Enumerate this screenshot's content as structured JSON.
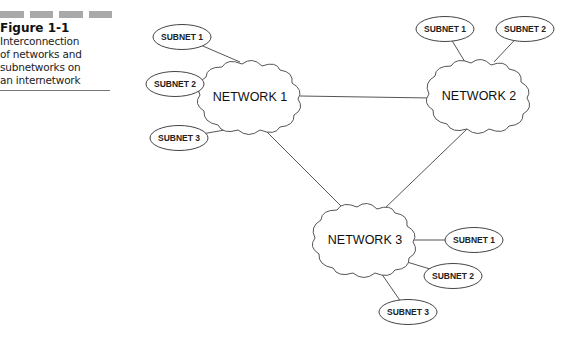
{
  "caption": {
    "figure_label": "Figure 1-1",
    "lines": [
      "Interconnection",
      "of networks and",
      "subnetworks on",
      "an internetwork"
    ],
    "bar_color": "#a9a9a9"
  },
  "networks": [
    {
      "id": "n1",
      "label": "NETWORK 1",
      "cx": 250,
      "cy": 97
    },
    {
      "id": "n2",
      "label": "NETWORK 2",
      "cx": 479,
      "cy": 96
    },
    {
      "id": "n3",
      "label": "NETWORK 3",
      "cx": 365,
      "cy": 240
    }
  ],
  "subnets": [
    {
      "network": "n1",
      "label": "SUBNET 1",
      "cx": 182,
      "cy": 37,
      "attach": [
        240,
        62
      ]
    },
    {
      "network": "n1",
      "label": "SUBNET 2",
      "cx": 175,
      "cy": 84,
      "attach": [
        202,
        93
      ]
    },
    {
      "network": "n1",
      "label": "SUBNET 3",
      "cx": 179,
      "cy": 138,
      "attach": [
        236,
        128
      ]
    },
    {
      "network": "n2",
      "label": "SUBNET 1",
      "cx": 445,
      "cy": 29,
      "attach": [
        465,
        62
      ]
    },
    {
      "network": "n2",
      "label": "SUBNET 2",
      "cx": 525,
      "cy": 29,
      "attach": [
        494,
        62
      ]
    },
    {
      "network": "n3",
      "label": "SUBNET 1",
      "cx": 474,
      "cy": 240,
      "attach": [
        414,
        240
      ]
    },
    {
      "network": "n3",
      "label": "SUBNET 2",
      "cx": 453,
      "cy": 276,
      "attach": [
        407,
        262
      ]
    },
    {
      "network": "n3",
      "label": "SUBNET 3",
      "cx": 408,
      "cy": 312,
      "attach": [
        381,
        273
      ]
    }
  ],
  "links": [
    {
      "from": "n1",
      "to": "n2",
      "x1": 300,
      "y1": 96,
      "x2": 431,
      "y2": 98
    },
    {
      "from": "n1",
      "to": "n3",
      "x1": 265,
      "y1": 130,
      "x2": 345,
      "y2": 210
    },
    {
      "from": "n2",
      "to": "n3",
      "x1": 467,
      "y1": 129,
      "x2": 383,
      "y2": 210
    }
  ]
}
